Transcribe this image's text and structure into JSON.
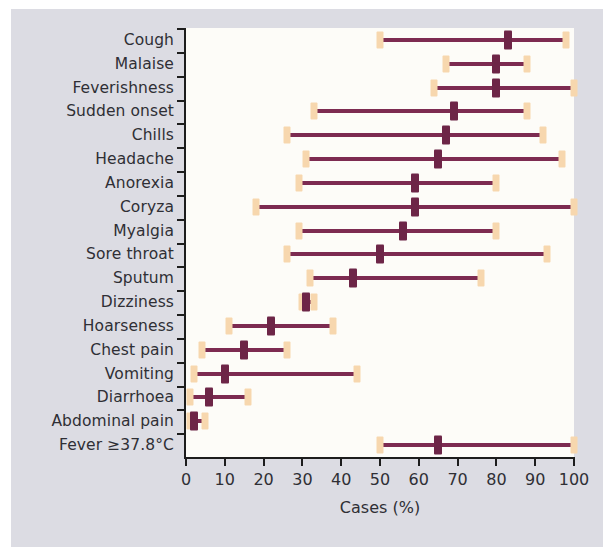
{
  "chart_data": {
    "type": "scatter",
    "title": "",
    "xlabel": "Cases (%)",
    "ylabel": "",
    "xlim": [
      0,
      100
    ],
    "xticks": [
      0,
      10,
      20,
      30,
      40,
      50,
      60,
      70,
      80,
      90,
      100
    ],
    "grid": false,
    "legend": null,
    "orientation": "horizontal",
    "marker_description": "point estimate with 95% confidence interval; square caps at interval ends",
    "colors": {
      "point": "#6d2547",
      "interval_line": "#7d2b51",
      "interval_cap": "#f7d7ae",
      "panel_background": "#fdfcf8",
      "figure_background": "#dcdce3",
      "axis": "#1d1d1d",
      "text": "#2f2f35"
    },
    "categories": [
      "Cough",
      "Malaise",
      "Feverishness",
      "Sudden onset",
      "Chills",
      "Headache",
      "Anorexia",
      "Coryza",
      "Myalgia",
      "Sore throat",
      "Sputum",
      "Dizziness",
      "Hoarseness",
      "Chest pain",
      "Vomiting",
      "Diarrhoea",
      "Abdominal pain",
      "Fever ≥37.8°C"
    ],
    "points": [
      83,
      80,
      80,
      69,
      67,
      65,
      59,
      59,
      56,
      50,
      43,
      31,
      22,
      15,
      10,
      6,
      2,
      65
    ],
    "ci_low": [
      50,
      67,
      64,
      33,
      26,
      31,
      29,
      18,
      29,
      26,
      32,
      30,
      11,
      4,
      2,
      1,
      1,
      50
    ],
    "ci_high": [
      98,
      88,
      100,
      88,
      92,
      97,
      80,
      100,
      80,
      93,
      76,
      33,
      38,
      26,
      44,
      16,
      5,
      100
    ],
    "series": [
      {
        "name": "Cough",
        "value": 83,
        "ci": [
          50,
          98
        ]
      },
      {
        "name": "Malaise",
        "value": 80,
        "ci": [
          67,
          88
        ]
      },
      {
        "name": "Feverishness",
        "value": 80,
        "ci": [
          64,
          100
        ]
      },
      {
        "name": "Sudden onset",
        "value": 69,
        "ci": [
          33,
          88
        ]
      },
      {
        "name": "Chills",
        "value": 67,
        "ci": [
          26,
          92
        ]
      },
      {
        "name": "Headache",
        "value": 65,
        "ci": [
          31,
          97
        ]
      },
      {
        "name": "Anorexia",
        "value": 59,
        "ci": [
          29,
          80
        ]
      },
      {
        "name": "Coryza",
        "value": 59,
        "ci": [
          18,
          100
        ]
      },
      {
        "name": "Myalgia",
        "value": 56,
        "ci": [
          29,
          80
        ]
      },
      {
        "name": "Sore throat",
        "value": 50,
        "ci": [
          26,
          93
        ]
      },
      {
        "name": "Sputum",
        "value": 43,
        "ci": [
          32,
          76
        ]
      },
      {
        "name": "Dizziness",
        "value": 31,
        "ci": [
          30,
          33
        ]
      },
      {
        "name": "Hoarseness",
        "value": 22,
        "ci": [
          11,
          38
        ]
      },
      {
        "name": "Chest pain",
        "value": 15,
        "ci": [
          4,
          26
        ]
      },
      {
        "name": "Vomiting",
        "value": 10,
        "ci": [
          2,
          44
        ]
      },
      {
        "name": "Diarrhoea",
        "value": 6,
        "ci": [
          1,
          16
        ]
      },
      {
        "name": "Abdominal pain",
        "value": 2,
        "ci": [
          1,
          5
        ]
      },
      {
        "name": "Fever ≥37.8°C",
        "value": 65,
        "ci": [
          50,
          100
        ]
      }
    ]
  }
}
